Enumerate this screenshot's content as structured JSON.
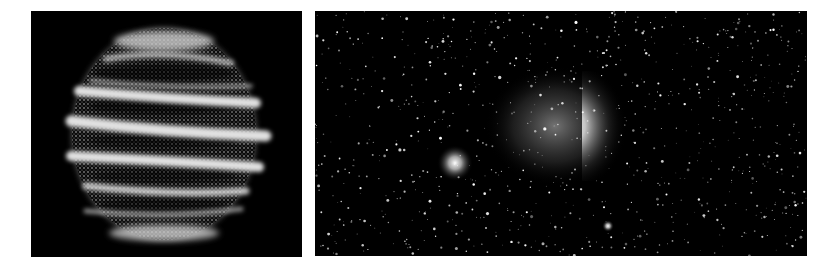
{
  "figure": {
    "panels": [
      {
        "id": "left",
        "description": "Simulated spherical particle cloud with wrapped tidal stream bands",
        "background": "#000000",
        "band_color": "#d8d8d8"
      },
      {
        "id": "right",
        "description": "Star field with diffuse galaxy cloud, bright core, and globular cluster",
        "background": "#000000",
        "star_color": "#ffffff"
      }
    ]
  }
}
